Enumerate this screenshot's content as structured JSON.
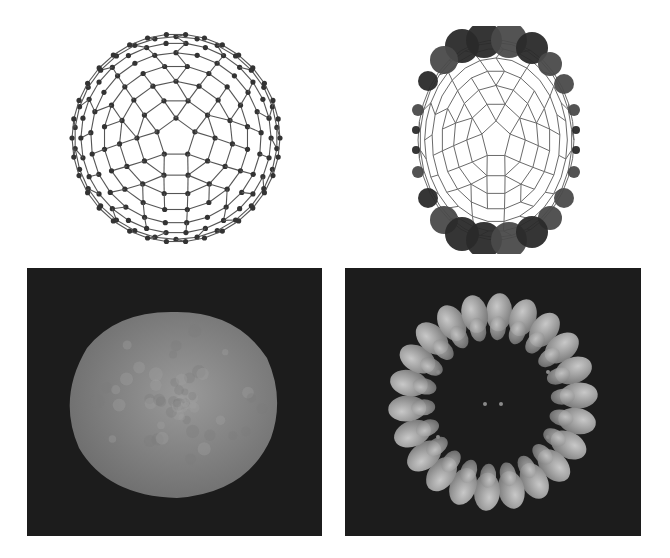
{
  "figure": {
    "panels": [
      {
        "id": "a",
        "kind": "wireframe-cage",
        "description": "Fullerene-like cage, ball-and-stick wireframe with dark atom nodes",
        "position": "top-left"
      },
      {
        "id": "b",
        "kind": "wireframe-cage-with-spheres",
        "description": "Same cage with large shaded spheres along top and bottom rims, smaller spheres at sides",
        "position": "top-right"
      },
      {
        "id": "c",
        "kind": "surface-render",
        "description": "Grey isosurface of the cage on dark background",
        "position": "bottom-left"
      },
      {
        "id": "d",
        "kind": "orbital-ring-render",
        "description": "Ring of lobed orbital isosurfaces on dark background",
        "position": "bottom-right"
      }
    ]
  },
  "colors": {
    "background": "#ffffff",
    "render_background": "#1c1c1c",
    "bond": "#555555",
    "atom": "#333333",
    "sphere_dark": "#2a2a2a",
    "sphere_mid": "#4a4a4a",
    "surface": "#8a8a8a",
    "lobe": "#a8a8a8"
  }
}
